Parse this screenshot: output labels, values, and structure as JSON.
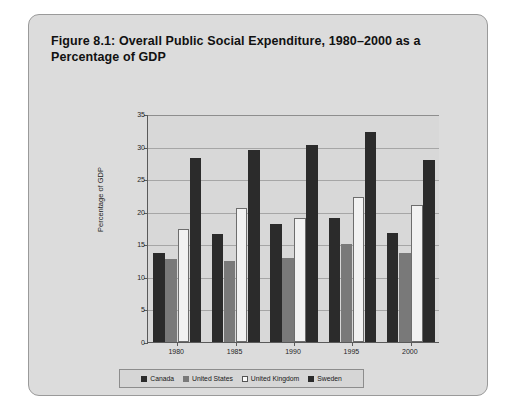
{
  "figure": {
    "title": "Figure 8.1: Overall Public Social Expenditure, 1980–2000 as a Percentage of GDP",
    "panel_bg": "#dcdcdc"
  },
  "chart_data": {
    "type": "bar",
    "title": "Figure 8.1: Overall Public Social Expenditure, 1980–2000 as a Percentage of GDP",
    "xlabel": "",
    "ylabel": "Percentage of GDP",
    "categories": [
      "1980",
      "1985",
      "1990",
      "1995",
      "2000"
    ],
    "ylim": [
      0,
      35
    ],
    "yticks": [
      0,
      5,
      10,
      15,
      20,
      25,
      30,
      35
    ],
    "grid": true,
    "legend_position": "bottom",
    "series": [
      {
        "name": "Canada",
        "color": "#2b2b2b",
        "values": [
          13.6,
          16.6,
          18.1,
          19.0,
          16.7
        ]
      },
      {
        "name": "United States",
        "color": "#797979",
        "values": [
          12.7,
          12.4,
          12.9,
          15.1,
          13.7
        ]
      },
      {
        "name": "United Kingdom",
        "color": "#f2f2f2",
        "values": [
          17.3,
          20.5,
          19.0,
          22.3,
          21.0
        ]
      },
      {
        "name": "Sweden",
        "color": "#2b2b2b",
        "values": [
          28.2,
          29.4,
          30.3,
          32.3,
          27.9
        ]
      }
    ]
  }
}
